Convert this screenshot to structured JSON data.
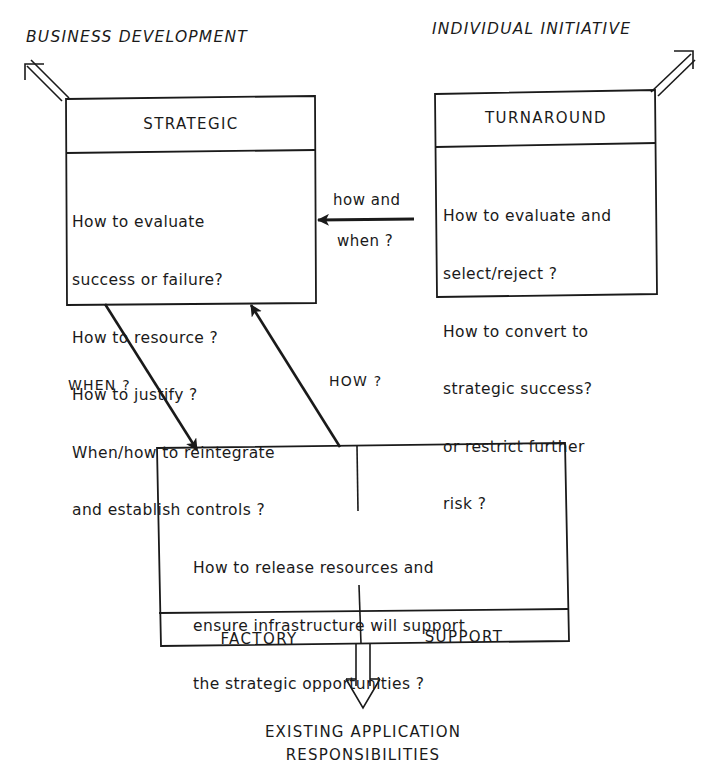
{
  "diagram": {
    "top_labels": {
      "left": "BUSINESS DEVELOPMENT",
      "right": "INDIVIDUAL INITIATIVE"
    },
    "boxes": {
      "strategic": {
        "title": "STRATEGIC",
        "lines": [
          "How to evaluate",
          "success or failure?",
          "How to resource ?",
          "How to justify ?",
          "When/how to reintegrate",
          "and establish controls ?"
        ]
      },
      "turnaround": {
        "title": "TURNAROUND",
        "lines": [
          "How to evaluate and",
          "select/reject ?",
          "How to convert to",
          "strategic success?",
          "or restrict further",
          "risk ?"
        ]
      },
      "operations": {
        "lines": [
          "How to release resources and",
          "ensure infrastructure will support",
          "the strategic opportunities ?"
        ],
        "left_title": "FACTORY",
        "right_title": "SUPPORT"
      }
    },
    "connectors": {
      "turnaround_to_strategic": {
        "label_top": "how and",
        "label_bottom": "when ?"
      },
      "strategic_to_operations": {
        "label": "WHEN ?"
      },
      "operations_to_strategic": {
        "label": "HOW ?"
      }
    },
    "bottom_label": {
      "line1": "EXISTING APPLICATION",
      "line2": "RESPONSIBILITIES"
    },
    "colors": {
      "ink": "#1a1a1a",
      "paper": "#ffffff"
    }
  }
}
